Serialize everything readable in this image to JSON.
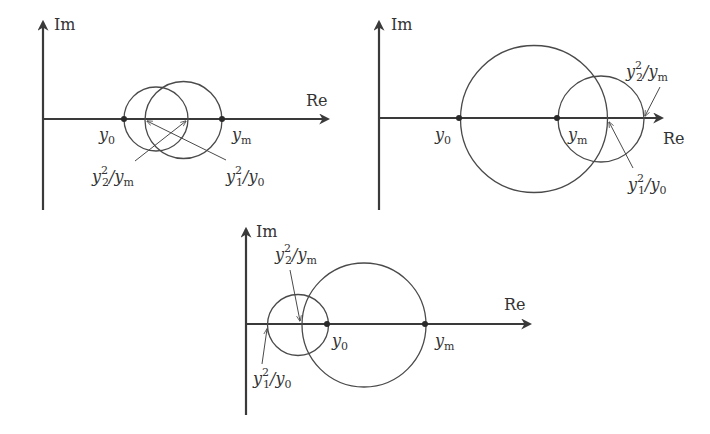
{
  "colors": {
    "axis": "#3a3a3a",
    "circle": "#4a4a4a",
    "text": "#333333",
    "background": "#ffffff"
  },
  "diagrams": [
    {
      "id": "top-left",
      "axis_labels": {
        "imag": "Im",
        "real": "Re"
      },
      "points": [
        {
          "name": "y0",
          "base": "y",
          "sub": "0"
        },
        {
          "name": "ym",
          "base": "y",
          "sub": "m"
        }
      ],
      "annotations": [
        {
          "name": "y2^2/ym",
          "num_base": "y",
          "num_sub": "2",
          "num_sup": "2",
          "slash": "/",
          "den_base": "y",
          "den_sub": "m"
        },
        {
          "name": "y1^2/y0",
          "num_base": "y",
          "num_sub": "1",
          "num_sup": "2",
          "slash": "/",
          "den_base": "y",
          "den_sub": "0"
        }
      ]
    },
    {
      "id": "top-right",
      "axis_labels": {
        "imag": "Im",
        "real": "Re"
      },
      "points": [
        {
          "name": "y0",
          "base": "y",
          "sub": "0"
        },
        {
          "name": "ym",
          "base": "y",
          "sub": "m"
        }
      ],
      "annotations": [
        {
          "name": "y2^2/ym",
          "num_base": "y",
          "num_sub": "2",
          "num_sup": "2",
          "slash": "/",
          "den_base": "y",
          "den_sub": "m"
        },
        {
          "name": "y1^2/y0",
          "num_base": "y",
          "num_sub": "1",
          "num_sup": "2",
          "slash": "/",
          "den_base": "y",
          "den_sub": "0"
        }
      ]
    },
    {
      "id": "bottom",
      "axis_labels": {
        "imag": "Im",
        "real": "Re"
      },
      "points": [
        {
          "name": "y0",
          "base": "y",
          "sub": "0"
        },
        {
          "name": "ym",
          "base": "y",
          "sub": "m"
        }
      ],
      "annotations": [
        {
          "name": "y2^2/ym",
          "num_base": "y",
          "num_sub": "2",
          "num_sup": "2",
          "slash": "/",
          "den_base": "y",
          "den_sub": "m"
        },
        {
          "name": "y1^2/y0",
          "num_base": "y",
          "num_sub": "1",
          "num_sup": "2",
          "slash": "/",
          "den_base": "y",
          "den_sub": "0"
        }
      ]
    }
  ]
}
